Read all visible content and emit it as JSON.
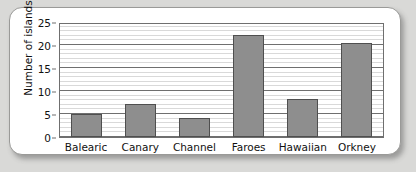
{
  "chart_data": {
    "type": "bar",
    "title": "",
    "xlabel": "",
    "ylabel": "Number of islands",
    "categories": [
      "Balearic",
      "Canary",
      "Channel",
      "Faroes",
      "Hawaiian",
      "Orkney"
    ],
    "values": [
      5,
      7.2,
      4.2,
      22.1,
      8.3,
      20.4
    ],
    "ylim": [
      0,
      25
    ],
    "yticks": [
      0,
      5,
      10,
      15,
      20,
      25
    ],
    "ytick_labels": [
      "0",
      "5",
      "10",
      "15",
      "20",
      "25"
    ],
    "grid": "horizontal major every 5 and minor every 1",
    "legend": "none",
    "bar_color": "#8e8e8e",
    "bar_border_color": "#4f4f4f",
    "axis_color": "#6f6f6f",
    "plot_background": "#ffffff",
    "page_background": "#d9d9d7"
  }
}
